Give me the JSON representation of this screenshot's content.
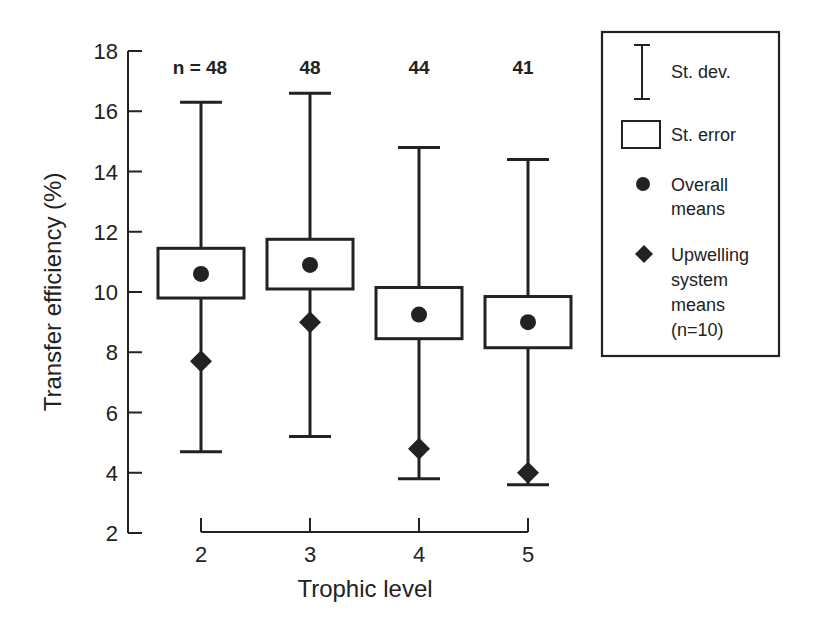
{
  "chart_data": {
    "type": "box",
    "title": "",
    "xlabel": "Trophic level",
    "ylabel": "Transfer efficiency (%)",
    "categories": [
      "2",
      "3",
      "4",
      "5"
    ],
    "ylim": [
      2,
      18
    ],
    "yticks": [
      2,
      4,
      6,
      8,
      10,
      12,
      14,
      16,
      18
    ],
    "grid": false,
    "legend_position": "right",
    "n_labels": [
      "n = 48",
      "48",
      "44",
      "41"
    ],
    "series": [
      {
        "name": "St. dev.",
        "kind": "whisker",
        "low": [
          4.7,
          5.2,
          3.8,
          3.6
        ],
        "high": [
          16.3,
          16.6,
          14.8,
          14.4
        ]
      },
      {
        "name": "St. error",
        "kind": "box",
        "low": [
          9.8,
          10.1,
          8.45,
          8.15
        ],
        "high": [
          11.45,
          11.75,
          10.15,
          9.85
        ]
      },
      {
        "name": "Overall means",
        "kind": "marker-circle",
        "values": [
          10.6,
          10.9,
          9.25,
          9.0
        ]
      },
      {
        "name": "Upwelling system means (n=10)",
        "kind": "marker-diamond",
        "values": [
          7.7,
          9.0,
          4.8,
          4.0
        ]
      }
    ],
    "legend": [
      {
        "symbol": "whisker",
        "lines": [
          "St. dev."
        ]
      },
      {
        "symbol": "box",
        "lines": [
          "St. error"
        ]
      },
      {
        "symbol": "circle",
        "lines": [
          "Overall",
          "means"
        ]
      },
      {
        "symbol": "diamond",
        "lines": [
          "Upwelling",
          "system",
          "means",
          "(n=10)"
        ]
      }
    ],
    "colors": {
      "ink": "#222222",
      "background": "#ffffff"
    }
  }
}
